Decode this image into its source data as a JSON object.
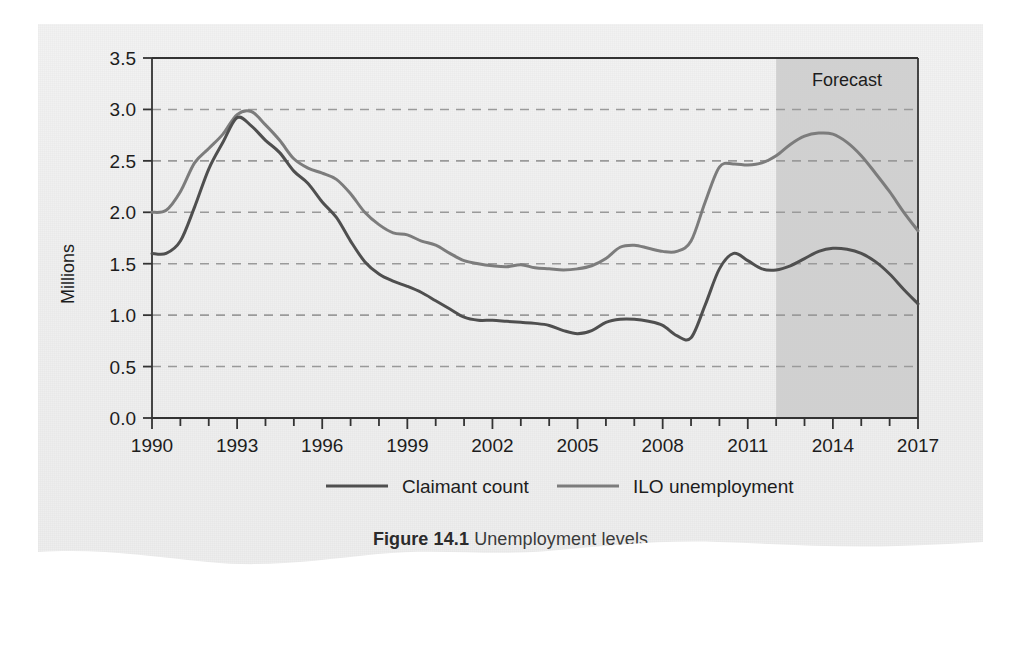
{
  "figure": {
    "caption_label": "Figure 14.1",
    "caption_title": "Unemployment levels",
    "source": "Source: Office of National Statistics"
  },
  "annotations": {
    "forecast_label": "Forecast"
  },
  "colors": {
    "claimant": "#4f4f4f",
    "ilo": "#7c7c7c",
    "forecast_shade": "#cfcfcf",
    "grid": "#9a9a9a",
    "axis": "#333333",
    "paper": "#efefef"
  },
  "chart_data": {
    "type": "line",
    "title": "Unemployment levels",
    "xlabel": "",
    "ylabel": "Millions",
    "xlim": [
      1990,
      2017
    ],
    "ylim": [
      0.0,
      3.5
    ],
    "grid": true,
    "legend_position": "bottom",
    "y_ticks": [
      "0.0",
      "0.5",
      "1.0",
      "1.5",
      "2.0",
      "2.5",
      "3.0",
      "3.5"
    ],
    "y_tick_values": [
      0.0,
      0.5,
      1.0,
      1.5,
      2.0,
      2.5,
      3.0,
      3.5
    ],
    "x_ticks": [
      "1990",
      "1993",
      "1996",
      "1999",
      "2002",
      "2005",
      "2008",
      "2011",
      "2014",
      "2017"
    ],
    "x_tick_values": [
      1990,
      1993,
      1996,
      1999,
      2002,
      2005,
      2008,
      2011,
      2014,
      2017
    ],
    "x_minor_step": 1,
    "forecast_start": 2012.0,
    "forecast_end": 2017,
    "x": [
      1990,
      1990.5,
      1991,
      1991.5,
      1992,
      1992.5,
      1993,
      1993.5,
      1994,
      1994.5,
      1995,
      1995.5,
      1996,
      1996.5,
      1997,
      1997.5,
      1998,
      1998.5,
      1999,
      1999.5,
      2000,
      2000.5,
      2001,
      2001.5,
      2002,
      2002.5,
      2003,
      2003.5,
      2004,
      2004.5,
      2005,
      2005.5,
      2006,
      2006.5,
      2007,
      2007.5,
      2008,
      2008.5,
      2009,
      2009.5,
      2010,
      2010.5,
      2011,
      2011.5,
      2012,
      2012.5,
      2013,
      2013.5,
      2014,
      2014.5,
      2015,
      2015.5,
      2016,
      2016.5,
      2017
    ],
    "series": [
      {
        "name": "ILO unemployment",
        "color": "#7c7c7c",
        "values": [
          2.0,
          2.02,
          2.2,
          2.48,
          2.62,
          2.76,
          2.95,
          2.98,
          2.85,
          2.7,
          2.52,
          2.43,
          2.38,
          2.32,
          2.18,
          2.0,
          1.88,
          1.8,
          1.78,
          1.72,
          1.68,
          1.6,
          1.53,
          1.5,
          1.48,
          1.47,
          1.49,
          1.46,
          1.45,
          1.44,
          1.45,
          1.48,
          1.55,
          1.66,
          1.68,
          1.65,
          1.62,
          1.62,
          1.72,
          2.1,
          2.44,
          2.47,
          2.46,
          2.48,
          2.55,
          2.66,
          2.74,
          2.77,
          2.76,
          2.68,
          2.55,
          2.38,
          2.2,
          2.0,
          1.82
        ]
      },
      {
        "name": "Claimant count",
        "color": "#4f4f4f",
        "values": [
          1.6,
          1.6,
          1.72,
          2.05,
          2.42,
          2.68,
          2.92,
          2.84,
          2.7,
          2.58,
          2.4,
          2.28,
          2.1,
          1.95,
          1.72,
          1.52,
          1.4,
          1.33,
          1.28,
          1.22,
          1.14,
          1.06,
          0.98,
          0.95,
          0.95,
          0.94,
          0.93,
          0.92,
          0.9,
          0.85,
          0.82,
          0.85,
          0.93,
          0.96,
          0.96,
          0.94,
          0.9,
          0.8,
          0.78,
          1.1,
          1.45,
          1.6,
          1.53,
          1.45,
          1.44,
          1.48,
          1.55,
          1.62,
          1.65,
          1.64,
          1.6,
          1.52,
          1.4,
          1.25,
          1.11
        ]
      }
    ],
    "legend": [
      {
        "label": "Claimant count",
        "color": "#4f4f4f"
      },
      {
        "label": "ILO unemployment",
        "color": "#7c7c7c"
      }
    ]
  }
}
